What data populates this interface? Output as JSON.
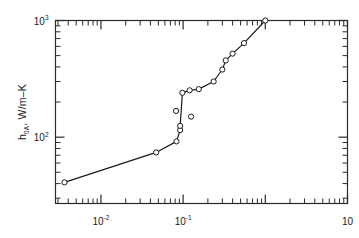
{
  "chart_data": {
    "type": "line",
    "title": "",
    "subtitle": "",
    "xlabel": "",
    "ylabel": "h0A, W/m-K",
    "ylabel_parts": {
      "symbol": "h",
      "subscript": "0A",
      "units": ", W/m–K"
    },
    "xscale": "log",
    "yscale": "log",
    "xlim": [
      0.0028,
      10
    ],
    "ylim": [
      27,
      1000
    ],
    "grid": false,
    "legend": null,
    "x_tick_labels": [
      {
        "value": 0.01,
        "label": "10",
        "exponent": "-2"
      },
      {
        "value": 0.1,
        "label": "10",
        "exponent": "-1"
      },
      {
        "value": 10,
        "label": "10",
        "exponent": ""
      }
    ],
    "y_tick_labels": [
      {
        "value": 1000,
        "label": "10",
        "exponent": "3"
      },
      {
        "value": 100,
        "label": "10",
        "exponent": "2"
      }
    ],
    "series": [
      {
        "name": "h0A curve",
        "marker": "open-circle",
        "line": "solid",
        "points": [
          {
            "x": 0.0036,
            "y": 41
          },
          {
            "x": 0.047,
            "y": 74
          },
          {
            "x": 0.083,
            "y": 92
          },
          {
            "x": 0.092,
            "y": 115
          },
          {
            "x": 0.092,
            "y": 125
          },
          {
            "x": 0.098,
            "y": 240
          },
          {
            "x": 0.12,
            "y": 252
          },
          {
            "x": 0.155,
            "y": 258
          },
          {
            "x": 0.235,
            "y": 300
          },
          {
            "x": 0.3,
            "y": 380
          },
          {
            "x": 0.33,
            "y": 455
          },
          {
            "x": 0.4,
            "y": 520
          },
          {
            "x": 0.55,
            "y": 640
          },
          {
            "x": 1.0,
            "y": 1000
          }
        ]
      },
      {
        "name": "scattered outliers",
        "marker": "open-circle",
        "line": "none",
        "points": [
          {
            "x": 0.082,
            "y": 168
          },
          {
            "x": 0.125,
            "y": 150
          }
        ]
      }
    ]
  },
  "figure": {
    "background_color": "#ffffff",
    "line_color": "#1a1a1a",
    "marker_fill": "#ffffff",
    "axis_color": "#2b2b2b"
  }
}
